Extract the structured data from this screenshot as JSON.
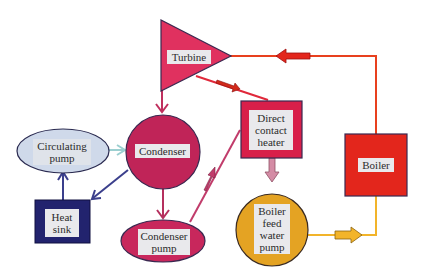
{
  "diagram": {
    "type": "power-plant-steam-cycle",
    "nodes": [
      {
        "id": "turbine",
        "label": "Turbine",
        "shape": "triangle",
        "color": "#e0315f"
      },
      {
        "id": "boiler",
        "label": "Boiler",
        "shape": "square",
        "color": "#e3261c"
      },
      {
        "id": "direct_contact_heater",
        "label": "Direct contact heater",
        "lines": [
          "Direct",
          "contact",
          "heater"
        ],
        "shape": "square",
        "color": "#d81f4a"
      },
      {
        "id": "condenser",
        "label": "Condenser",
        "shape": "circle",
        "color": "#c02458"
      },
      {
        "id": "circulating_pump",
        "label": "Circulating pump",
        "lines": [
          "Circulating",
          "pump"
        ],
        "shape": "ellipse",
        "color": "#cfd9ea"
      },
      {
        "id": "heat_sink",
        "label": "Heat sink",
        "lines": [
          "Heat",
          "sink"
        ],
        "shape": "square",
        "color": "#22236e"
      },
      {
        "id": "condenser_pump",
        "label": "Condenser pump",
        "lines": [
          "Condenser",
          "pump"
        ],
        "shape": "ellipse",
        "color": "#c8275c"
      },
      {
        "id": "boiler_feed_water_pump",
        "label": "Boiler feed water pump",
        "lines": [
          "Boiler",
          "feed",
          "water",
          "pump"
        ],
        "shape": "circle",
        "color": "#e4a323"
      }
    ],
    "edges": [
      {
        "from": "boiler",
        "to": "turbine",
        "color": "#e8401e"
      },
      {
        "from": "turbine",
        "to": "direct_contact_heater",
        "color": "#e0283a"
      },
      {
        "from": "turbine",
        "to": "condenser",
        "color": "#c0305e"
      },
      {
        "from": "condenser",
        "to": "condenser_pump",
        "color": "#b5305e"
      },
      {
        "from": "condenser_pump",
        "to": "direct_contact_heater",
        "color": "#c13c6b"
      },
      {
        "from": "direct_contact_heater",
        "to": "boiler_feed_water_pump",
        "color": "#d48ca5"
      },
      {
        "from": "boiler_feed_water_pump",
        "to": "boiler",
        "color": "#f2b42a"
      },
      {
        "from": "circulating_pump",
        "to": "condenser",
        "color": "#9ccfd0"
      },
      {
        "from": "condenser",
        "to": "heat_sink",
        "color": "#3b3f8c"
      },
      {
        "from": "heat_sink",
        "to": "circulating_pump",
        "color": "#3b3f8c"
      }
    ]
  },
  "labels": {
    "turbine": "Turbine",
    "boiler": "Boiler",
    "dch1": "Direct",
    "dch2": "contact",
    "dch3": "heater",
    "condenser": "Condenser",
    "cp1": "Circulating",
    "cp2": "pump",
    "hs1": "Heat",
    "hs2": "sink",
    "cnp1": "Condenser",
    "cnp2": "pump",
    "bfw1": "Boiler",
    "bfw2": "feed",
    "bfw3": "water",
    "bfw4": "pump"
  }
}
